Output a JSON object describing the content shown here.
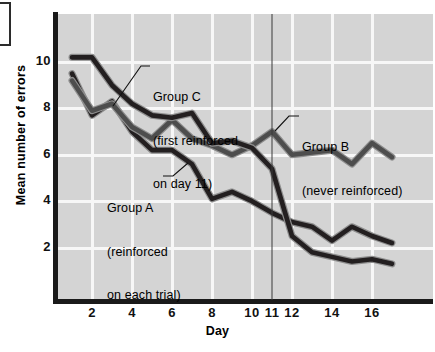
{
  "figure": {
    "background": "#d4d4d4",
    "line_color_dark": "#231f20",
    "line_color_mid": "#4d4d4d"
  },
  "chart_data": {
    "type": "line",
    "title": "",
    "xlabel": "Day",
    "ylabel": "Mean number of errors",
    "xlim": [
      0.4,
      18.2
    ],
    "ylim": [
      0,
      11.3
    ],
    "xticks": [
      "2",
      "4",
      "6",
      "8",
      "10",
      "11",
      "12",
      "14",
      "16"
    ],
    "xtick_values": [
      2,
      4,
      6,
      8,
      10,
      11,
      12,
      14,
      16
    ],
    "yticks": [
      "10",
      "8",
      "6",
      "4",
      "2"
    ],
    "ytick_values": [
      10,
      8,
      6,
      4,
      2
    ],
    "grid": true,
    "legend_position": "inline-annotations",
    "x": [
      1,
      2,
      3,
      4,
      5,
      6,
      7,
      8,
      9,
      10,
      11,
      12,
      13,
      14,
      15,
      16,
      17
    ],
    "series": [
      {
        "name": "Group A",
        "label": "Group A",
        "sublabel": "(reinforced\non each trial)",
        "color": "#231f20",
        "values": [
          9.5,
          7.7,
          8.3,
          7.0,
          6.2,
          6.2,
          5.6,
          4.1,
          4.4,
          4.0,
          3.5,
          3.1,
          2.9,
          2.3,
          2.9,
          2.5,
          2.2
        ]
      },
      {
        "name": "Group B",
        "label": "Group B",
        "sublabel": "(never reinforced)",
        "color": "#4d4d4d",
        "values": [
          9.2,
          7.9,
          8.2,
          7.2,
          6.7,
          7.5,
          6.7,
          6.4,
          6.0,
          6.4,
          7.0,
          6.0,
          6.1,
          6.2,
          5.6,
          6.5,
          5.9
        ]
      },
      {
        "name": "Group C",
        "label": "Group C",
        "sublabel": "(first reinforced\non day 11)",
        "color": "#231f20",
        "values": [
          10.2,
          10.2,
          9.0,
          8.2,
          7.7,
          7.6,
          7.8,
          6.5,
          6.6,
          6.3,
          5.4,
          2.5,
          1.8,
          1.6,
          1.4,
          1.5,
          1.3
        ]
      }
    ],
    "annotations": [
      {
        "name": "group-c-annotation",
        "text_line1": "Group C",
        "text_line2": "(first reinforced",
        "text_line3": "on day 11)"
      },
      {
        "name": "group-b-annotation",
        "text_line1": "Group B",
        "text_line2": "(never reinforced)"
      },
      {
        "name": "group-a-annotation",
        "text_line1": "Group A",
        "text_line2": "(reinforced",
        "text_line3": "on each trial)"
      }
    ],
    "marker": {
      "name": "day-11-marker",
      "x_value": 11,
      "description": "vertical reference line at day 11"
    }
  }
}
